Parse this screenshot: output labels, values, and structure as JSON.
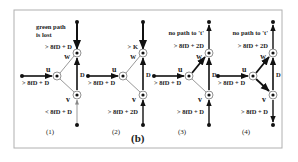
{
  "figure_label": "(b)",
  "colors": {
    "frame": "#b0b0b0",
    "ink": "#111111",
    "light_edge": "#999999"
  },
  "panels": [
    {
      "id": "1",
      "caption": "(1)",
      "top_note_line1": "green path",
      "top_note_line2": "is lost",
      "upper_label": "> 8fD + D",
      "left_label": "> 8fD + D",
      "lower_label": "< 8fD + D",
      "nodes": {
        "u": "u",
        "w": "w",
        "v": "v"
      },
      "edge_label": "D"
    },
    {
      "id": "2",
      "caption": "(2)",
      "top_note_line1": "",
      "top_note_line2": "",
      "upper_label": "> K",
      "left_label": "> 8fD + D",
      "lower_label": "> 8fD + 2D",
      "nodes": {
        "u": "u",
        "w": "w",
        "v": "v"
      },
      "edge_label": "D"
    },
    {
      "id": "3",
      "caption": "(3)",
      "top_note_line1": "no path to 't'",
      "top_note_line2": "",
      "upper_label": "> 8fD + 2D",
      "left_label": "> 8fD + D",
      "lower_label": "> 8fD + D",
      "nodes": {
        "u": "u",
        "w": "w",
        "v": "v"
      },
      "edge_label": "D"
    },
    {
      "id": "4",
      "caption": "(4)",
      "top_note_line1": "no path to 't'",
      "top_note_line2": "",
      "upper_label": "> 8fD + 2D",
      "left_label": "> 8fD + D",
      "lower_label": "> 8fD + D",
      "nodes": {
        "u": "u",
        "w": "w",
        "v": "v"
      },
      "edge_label": "D"
    }
  ]
}
